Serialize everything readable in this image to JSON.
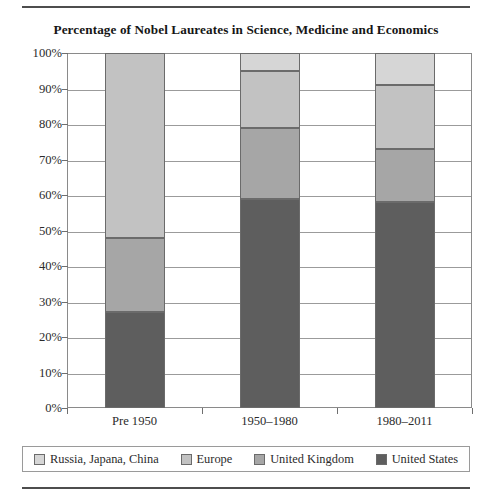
{
  "chart_data": {
    "type": "bar",
    "subtype": "stacked-percent",
    "title": "Percentage of Nobel Laureates in Science, Medicine and Economics",
    "xlabel": "",
    "ylabel": "",
    "ylim": [
      0,
      100
    ],
    "ytick_labels": [
      "100%",
      "90%",
      "80%",
      "70%",
      "60%",
      "50%",
      "40%",
      "30%",
      "20%",
      "10%",
      "0%"
    ],
    "ytick_values": [
      100,
      90,
      80,
      70,
      60,
      50,
      40,
      30,
      20,
      10,
      0
    ],
    "grid": true,
    "legend_position": "bottom",
    "categories": [
      "Pre 1950",
      "1950–1980",
      "1980–2011"
    ],
    "series": [
      {
        "name": "United States",
        "color": "#5e5e5e",
        "values": [
          27,
          59,
          58
        ]
      },
      {
        "name": "United Kingdom",
        "color": "#a6a6a6",
        "values": [
          21,
          20,
          15
        ]
      },
      {
        "name": "Europe",
        "color": "#c2c2c2",
        "values": [
          52,
          16,
          18
        ]
      },
      {
        "name": "Russia, Japana, China",
        "color": "#d6d6d6",
        "values": [
          0,
          5,
          9
        ]
      }
    ],
    "stack_order_bottom_to_top": [
      "United States",
      "United Kingdom",
      "Europe",
      "Russia, Japana, China"
    ]
  },
  "legend": {
    "items": [
      {
        "label": "Russia, Japana, China",
        "color": "#d6d6d6"
      },
      {
        "label": "Europe",
        "color": "#c2c2c2"
      },
      {
        "label": "United Kingdom",
        "color": "#a6a6a6"
      },
      {
        "label": "United States",
        "color": "#5e5e5e"
      }
    ]
  }
}
